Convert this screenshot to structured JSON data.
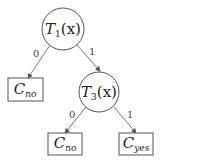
{
  "diagram": {
    "type": "decision-tree",
    "colors": {
      "stroke": "#555555",
      "text": "#222222",
      "background": "#ffffff"
    },
    "nodes": [
      {
        "id": "t1",
        "shape": "circle",
        "base": "T",
        "sub": "1",
        "arg": "(x)",
        "label": "T1(x)"
      },
      {
        "id": "t3",
        "shape": "circle",
        "base": "T",
        "sub": "3",
        "arg": "(x)",
        "label": "T3(x)"
      },
      {
        "id": "c_no_1",
        "shape": "box",
        "base": "C",
        "sub": "no",
        "label": "C_no"
      },
      {
        "id": "c_no_2",
        "shape": "box",
        "base": "C",
        "sub": "no",
        "label": "C_no"
      },
      {
        "id": "c_yes",
        "shape": "box",
        "base": "C",
        "sub": "yes",
        "label": "C_yes"
      }
    ],
    "edges": [
      {
        "from": "t1",
        "to": "c_no_1",
        "label": "0"
      },
      {
        "from": "t1",
        "to": "t3",
        "label": "1"
      },
      {
        "from": "t3",
        "to": "c_no_2",
        "label": "0"
      },
      {
        "from": "t3",
        "to": "c_yes",
        "label": "1"
      }
    ]
  }
}
